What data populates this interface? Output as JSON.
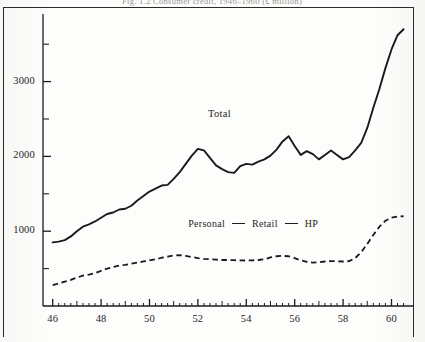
{
  "figure": {
    "caption": "Fig. 1.2   Consumer credit,  1946–1960   (£ million)",
    "page_border": true
  },
  "chart_data": {
    "type": "line",
    "title": "",
    "xlabel": "",
    "ylabel": "",
    "xlim": [
      45.6,
      60.6
    ],
    "ylim": [
      0,
      3850
    ],
    "grid": false,
    "legend_position": "inside-center-lower",
    "y_ticks_major": [
      1000,
      2000,
      3000
    ],
    "y_ticks_minor": [
      500,
      1500,
      2500,
      3500
    ],
    "x_ticks_major": [
      46,
      48,
      50,
      52,
      54,
      56,
      58,
      60
    ],
    "x_ticks_minor_step": 0.25,
    "annotations": [
      {
        "text": "Total",
        "x": 53.0,
        "y": 2550
      }
    ],
    "legend_entries": [
      {
        "label": "Personal",
        "marker": "none"
      },
      {
        "label": "Retail",
        "marker": "dash"
      },
      {
        "label": "HP",
        "marker": "dash"
      }
    ],
    "series": [
      {
        "name": "Total",
        "style": "solid",
        "color": "#1a1a1a",
        "x": [
          46.0,
          46.25,
          46.5,
          46.75,
          47.0,
          47.25,
          47.5,
          47.75,
          48.0,
          48.25,
          48.5,
          48.75,
          49.0,
          49.25,
          49.5,
          49.75,
          50.0,
          50.25,
          50.5,
          50.75,
          51.0,
          51.25,
          51.5,
          51.75,
          52.0,
          52.25,
          52.5,
          52.75,
          53.0,
          53.25,
          53.5,
          53.75,
          54.0,
          54.25,
          54.5,
          54.75,
          55.0,
          55.25,
          55.5,
          55.75,
          56.0,
          56.25,
          56.5,
          56.75,
          57.0,
          57.25,
          57.5,
          57.75,
          58.0,
          58.25,
          58.5,
          58.75,
          59.0,
          59.25,
          59.5,
          59.75,
          60.0,
          60.25,
          60.5
        ],
        "y": [
          850,
          860,
          880,
          930,
          1000,
          1060,
          1090,
          1130,
          1180,
          1230,
          1250,
          1290,
          1300,
          1340,
          1410,
          1470,
          1530,
          1570,
          1610,
          1620,
          1700,
          1790,
          1900,
          2010,
          2100,
          2080,
          1980,
          1880,
          1830,
          1790,
          1780,
          1870,
          1900,
          1890,
          1930,
          1960,
          2010,
          2090,
          2200,
          2270,
          2140,
          2020,
          2070,
          2030,
          1960,
          2020,
          2080,
          2020,
          1960,
          1990,
          2080,
          2180,
          2380,
          2650,
          2900,
          3180,
          3430,
          3620,
          3700
        ]
      },
      {
        "name": "Personal / Retail / HP",
        "style": "dashed",
        "color": "#1a1a1a",
        "x": [
          46.0,
          46.25,
          46.5,
          46.75,
          47.0,
          47.25,
          47.5,
          47.75,
          48.0,
          48.25,
          48.5,
          48.75,
          49.0,
          49.25,
          49.5,
          49.75,
          50.0,
          50.25,
          50.5,
          50.75,
          51.0,
          51.25,
          51.5,
          51.75,
          52.0,
          52.25,
          52.5,
          52.75,
          53.0,
          53.25,
          53.5,
          53.75,
          54.0,
          54.25,
          54.5,
          54.75,
          55.0,
          55.25,
          55.5,
          55.75,
          56.0,
          56.25,
          56.5,
          56.75,
          57.0,
          57.25,
          57.5,
          57.75,
          58.0,
          58.25,
          58.5,
          58.75,
          59.0,
          59.25,
          59.5,
          59.75,
          60.0,
          60.25,
          60.5
        ],
        "y": [
          280,
          300,
          325,
          350,
          380,
          405,
          420,
          440,
          470,
          500,
          520,
          540,
          550,
          565,
          580,
          595,
          610,
          625,
          645,
          660,
          675,
          680,
          670,
          655,
          640,
          630,
          625,
          620,
          615,
          615,
          612,
          610,
          608,
          610,
          615,
          625,
          650,
          665,
          670,
          665,
          640,
          610,
          590,
          580,
          585,
          595,
          600,
          598,
          595,
          600,
          640,
          720,
          830,
          950,
          1060,
          1140,
          1180,
          1195,
          1200
        ]
      }
    ]
  },
  "axis_labels": {
    "y": [
      "3000",
      "2000",
      "1000"
    ],
    "x": [
      "46",
      "48",
      "50",
      "52",
      "54",
      "56",
      "58",
      "60"
    ]
  }
}
